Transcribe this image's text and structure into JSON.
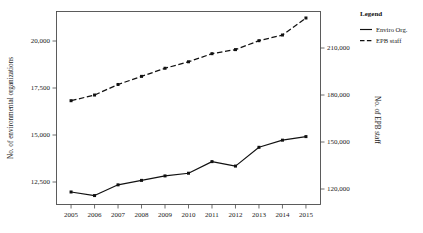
{
  "chart_data": {
    "type": "line",
    "title": "",
    "xlabel": "",
    "categories": [
      "2005",
      "2006",
      "2007",
      "2008",
      "2009",
      "2010",
      "2011",
      "2012",
      "2013",
      "2014",
      "2015"
    ],
    "grid": false,
    "legend": {
      "title": "Legend",
      "position": "right",
      "entries": [
        {
          "name": "Enviro Org.",
          "style": "solid"
        },
        {
          "name": "EPB staff",
          "style": "dashed"
        }
      ]
    },
    "axes": {
      "left": {
        "label": "No. of environmental organizations",
        "ticks": [
          "12,500",
          "15,000",
          "17,500",
          "20,000"
        ],
        "tick_values": [
          12500,
          15000,
          17500,
          20000
        ],
        "ylim": [
          11000,
          21800
        ]
      },
      "right": {
        "label": "No. of EPB staff",
        "ticks": [
          "120,000",
          "150,000",
          "180,000",
          "210,000"
        ],
        "tick_values": [
          120000,
          150000,
          180000,
          210000
        ],
        "ylim": [
          113000,
          232000
        ]
      },
      "bottom": {
        "ticks": [
          "2005",
          "2006",
          "2007",
          "2008",
          "2009",
          "2010",
          "2011",
          "2012",
          "2013",
          "2014",
          "2015"
        ]
      }
    },
    "series": [
      {
        "name": "Enviro Org.",
        "axis": "left",
        "style": "solid",
        "marker": "filled-square",
        "values": [
          11700,
          11500,
          12100,
          12350,
          12600,
          12750,
          13400,
          13150,
          14200,
          14600,
          14800
        ]
      },
      {
        "name": "EPB staff",
        "axis": "right",
        "style": "dashed",
        "marker": "filled-square",
        "values": [
          177000,
          180500,
          187000,
          192000,
          197000,
          201000,
          206000,
          208500,
          214000,
          217500,
          228000
        ]
      }
    ]
  }
}
